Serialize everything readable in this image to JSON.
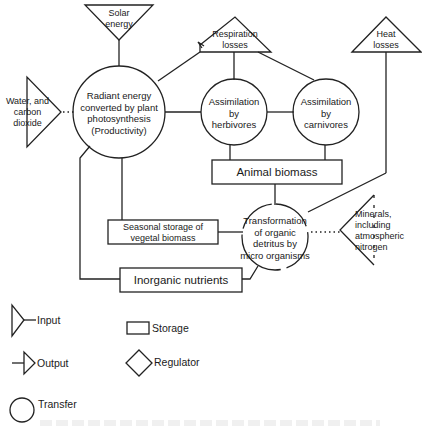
{
  "diagram": {
    "inputs": {
      "solar_energy": [
        "Solar",
        "energy"
      ],
      "water_co2": [
        "Water, and",
        "carbon",
        "dioxide"
      ],
      "minerals": [
        "Minerals,",
        "including",
        "atmospheric",
        "nitrogen"
      ]
    },
    "outputs": {
      "respiration_losses": [
        "Respiration",
        "losses"
      ],
      "heat_losses": [
        "Heat",
        "losses"
      ]
    },
    "transfers": {
      "productivity": [
        "Radiant energy",
        "converted by plant",
        "photosynthesis",
        "(Productivity)"
      ],
      "herbivores": [
        "Assimilation",
        "by",
        "herbivores"
      ],
      "carnivores": [
        "Assimilation",
        "by",
        "carnivores"
      ],
      "decomposition": [
        "Transformation",
        "of organic",
        "detritus by",
        "micro organisms"
      ]
    },
    "storages": {
      "animal_biomass": "Animal biomass",
      "seasonal_storage": [
        "Seasonal storage of",
        "vegetal biomass"
      ],
      "inorganic_nutrients": "Inorganic nutrients"
    }
  },
  "legend": {
    "input": "Input",
    "output": "Output",
    "transfer": "Transfer",
    "storage": "Storage",
    "regulator": "Regulator"
  }
}
